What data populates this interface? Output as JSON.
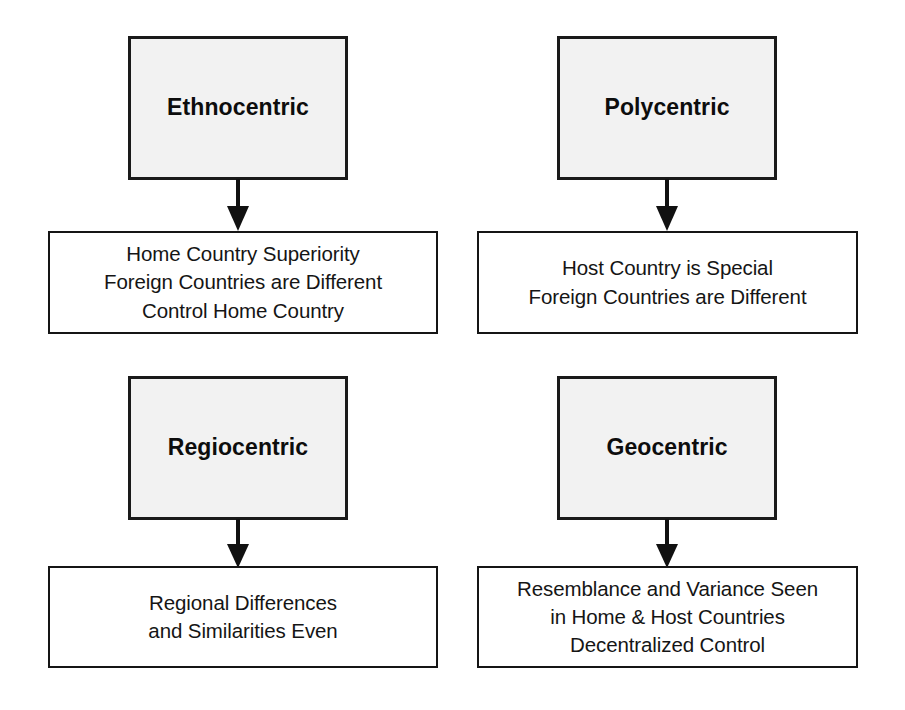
{
  "diagram": {
    "type": "concept-grid",
    "colors": {
      "heading_fill": "#f2f2f2",
      "heading_border": "#1a1a1a",
      "desc_fill": "#ffffff",
      "desc_border": "#151515",
      "text": "#151515",
      "arrow": "#111111",
      "background": "#ffffff"
    },
    "groups": [
      {
        "id": "ethnocentric",
        "heading": "Ethnocentric",
        "arrow_icon": "arrow-down-icon",
        "description_lines": [
          "Home Country Superiority",
          "Foreign Countries are Different",
          "Control Home Country"
        ],
        "description": "Home Country Superiority\nForeign Countries are Different\nControl Home Country"
      },
      {
        "id": "polycentric",
        "heading": "Polycentric",
        "arrow_icon": "arrow-down-icon",
        "description_lines": [
          "Host Country is Special",
          "Foreign Countries are Different"
        ],
        "description": "Host Country is Special\nForeign Countries are Different"
      },
      {
        "id": "regiocentric",
        "heading": "Regiocentric",
        "arrow_icon": "arrow-down-icon",
        "description_lines": [
          "Regional Differences",
          "and Similarities Even"
        ],
        "description": "Regional Differences\nand Similarities Even"
      },
      {
        "id": "geocentric",
        "heading": "Geocentric",
        "arrow_icon": "arrow-down-icon",
        "description_lines": [
          "Resemblance and Variance Seen",
          "in Home & Host Countries",
          "Decentralized Control"
        ],
        "description": "Resemblance and Variance Seen\nin Home & Host Countries\nDecentralized Control"
      }
    ]
  }
}
